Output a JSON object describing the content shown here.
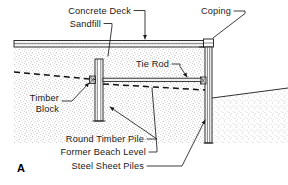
{
  "figure": {
    "id": "A",
    "type": "engineering-cross-section"
  },
  "labels": {
    "concrete_deck": "Concrete Deck",
    "sandfill": "Sandfill",
    "coping": "Coping",
    "tie_rod": "Tie Rod",
    "timber_block_line1": "Timber",
    "timber_block_line2": "Block",
    "round_timber_pile": "Round Timber Pile",
    "former_beach_level": "Former Beach Level",
    "steel_sheet_piles": "Steel Sheet Piles"
  },
  "colors": {
    "ink": "#1a1a1a",
    "paper": "#ffffff",
    "fill_stipple": "#8a8a8a",
    "concrete": "#f2f2f2"
  }
}
